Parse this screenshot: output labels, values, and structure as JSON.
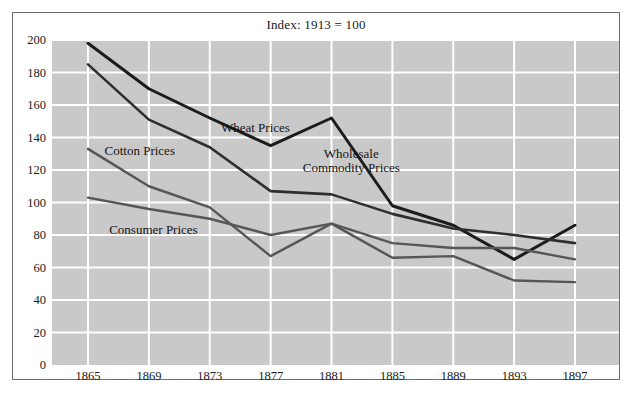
{
  "chart_data": {
    "type": "line",
    "title": "Index: 1913 = 100",
    "xlabel": "",
    "ylabel": "",
    "x": [
      1865,
      1869,
      1873,
      1877,
      1881,
      1885,
      1889,
      1893,
      1897
    ],
    "xtick_labels": [
      "1865",
      "1869",
      "1873",
      "1877",
      "1881",
      "1885",
      "1889",
      "1893",
      "1897"
    ],
    "ytick_labels": [
      "0",
      "20",
      "40",
      "60",
      "80",
      "100",
      "120",
      "140",
      "160",
      "180",
      "200"
    ],
    "yticks": [
      0,
      20,
      40,
      60,
      80,
      100,
      120,
      140,
      160,
      180,
      200
    ],
    "ylim": [
      0,
      200
    ],
    "xlim": [
      1865,
      1897
    ],
    "grid": true,
    "grid_color": "#ffffff",
    "plot_background": "#c9c9c9",
    "legend": "inline-annotations",
    "series": [
      {
        "name": "Wheat Prices",
        "color": "#1c1c1c",
        "width": 3.0,
        "values": [
          198,
          170,
          152,
          135,
          152,
          98,
          86,
          65,
          86
        ]
      },
      {
        "name": "Wholesale Commodity Prices",
        "color": "#2e2e2e",
        "width": 2.6,
        "values": [
          185,
          151,
          134,
          107,
          105,
          93,
          84,
          80,
          75
        ]
      },
      {
        "name": "Cotton Prices",
        "color": "#565656",
        "width": 2.4,
        "values": [
          133,
          110,
          97,
          67,
          87,
          75,
          72,
          72,
          65
        ]
      },
      {
        "name": "Consumer Prices",
        "color": "#565656",
        "width": 2.4,
        "values": [
          103,
          96,
          90,
          80,
          87,
          66,
          67,
          52,
          51
        ]
      }
    ],
    "annotations": [
      {
        "id": "wheat-label",
        "text": "Wheat Prices",
        "x": 1876.0,
        "y": 146
      },
      {
        "id": "wholesale-label",
        "text_line1": "Wholesale",
        "text_line2": "Commodity Prices",
        "x": 1882.3,
        "y": 125
      },
      {
        "id": "cotton-label",
        "text": "Cotton Prices",
        "x": 1868.4,
        "y": 132
      },
      {
        "id": "consumer-label",
        "text": "Consumer Prices",
        "x": 1869.3,
        "y": 83
      }
    ]
  }
}
